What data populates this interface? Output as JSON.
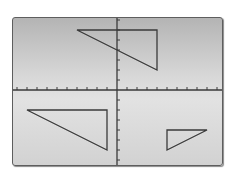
{
  "screen": {
    "label": "Graphing calculator coordinate grid",
    "bg_top": "#b4b4b4",
    "bg_bottom": "#d2d2d2",
    "line_color": "#3a3a3a"
  },
  "axes": {
    "x_range": [
      -10,
      10
    ],
    "y_range": [
      -7,
      7
    ],
    "x_tick_step": 1,
    "y_tick_step": 1,
    "origin_px": [
      117,
      90
    ],
    "unit_px": 10
  },
  "shapes": [
    {
      "name": "triangle-top",
      "vertices": [
        [
          -4,
          6
        ],
        [
          4,
          6
        ],
        [
          4,
          2
        ]
      ]
    },
    {
      "name": "triangle-bottom-left",
      "vertices": [
        [
          -9,
          -2
        ],
        [
          -1,
          -2
        ],
        [
          -1,
          -6
        ]
      ]
    },
    {
      "name": "triangle-bottom-right",
      "vertices": [
        [
          5,
          -4
        ],
        [
          9,
          -4
        ],
        [
          5,
          -6
        ]
      ]
    }
  ]
}
